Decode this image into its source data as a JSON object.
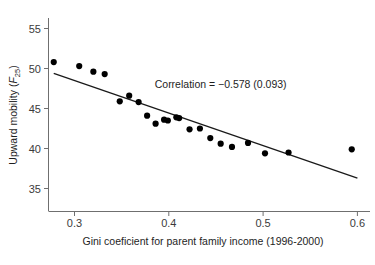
{
  "chart_data": {
    "type": "scatter",
    "title": "",
    "xlabel": "Gini coeficient for parent family income (1996-2000)",
    "ylabel": "Upward mobility (F25)",
    "ylabel_main": "Upward mobility (",
    "ylabel_var": "F",
    "ylabel_sub": "25",
    "ylabel_close": ")",
    "xlim": [
      0.265,
      0.605
    ],
    "ylim": [
      32.0,
      56.5
    ],
    "xticks": [
      0.3,
      0.4,
      0.5,
      0.6
    ],
    "xtick_labels": [
      "0.3",
      "0.4",
      "0.5",
      "0.6"
    ],
    "yticks": [
      35,
      40,
      45,
      50,
      55
    ],
    "ytick_labels": [
      "35",
      "40",
      "45",
      "50",
      "55"
    ],
    "grid": false,
    "legend": null,
    "annotations": [
      {
        "text": "Correlation = −0.578 (0.093)",
        "x": 0.455,
        "y": 47.6
      }
    ],
    "x": [
      0.278,
      0.305,
      0.32,
      0.332,
      0.348,
      0.358,
      0.368,
      0.377,
      0.386,
      0.395,
      0.399,
      0.408,
      0.411,
      0.422,
      0.433,
      0.444,
      0.455,
      0.467,
      0.484,
      0.502,
      0.527,
      0.594
    ],
    "y": [
      50.8,
      50.3,
      49.6,
      49.3,
      45.9,
      46.6,
      45.8,
      44.1,
      43.1,
      43.6,
      43.5,
      43.9,
      43.8,
      42.4,
      42.5,
      41.3,
      40.6,
      40.2,
      40.7,
      39.4,
      39.5,
      39.9
    ],
    "series": [
      {
        "name": "Commuting zones",
        "marker": "filled-circle",
        "color": "#000000",
        "points": [
          [
            0.278,
            50.8
          ],
          [
            0.305,
            50.3
          ],
          [
            0.32,
            49.6
          ],
          [
            0.332,
            49.3
          ],
          [
            0.348,
            45.9
          ],
          [
            0.358,
            46.6
          ],
          [
            0.368,
            45.8
          ],
          [
            0.377,
            44.1
          ],
          [
            0.386,
            43.1
          ],
          [
            0.395,
            43.6
          ],
          [
            0.399,
            43.5
          ],
          [
            0.408,
            43.9
          ],
          [
            0.411,
            43.8
          ],
          [
            0.422,
            42.4
          ],
          [
            0.433,
            42.5
          ],
          [
            0.444,
            41.3
          ],
          [
            0.455,
            40.6
          ],
          [
            0.467,
            40.2
          ],
          [
            0.484,
            40.7
          ],
          [
            0.502,
            39.4
          ],
          [
            0.527,
            39.5
          ],
          [
            0.594,
            39.9
          ]
        ]
      }
    ],
    "fit_line": {
      "name": "linear fit",
      "color": "#1a1a1a",
      "x0": 0.278,
      "y0": 49.4,
      "x1": 0.6,
      "y1": 36.3
    },
    "correlation": -0.578,
    "correlation_std_error": 0.093
  }
}
